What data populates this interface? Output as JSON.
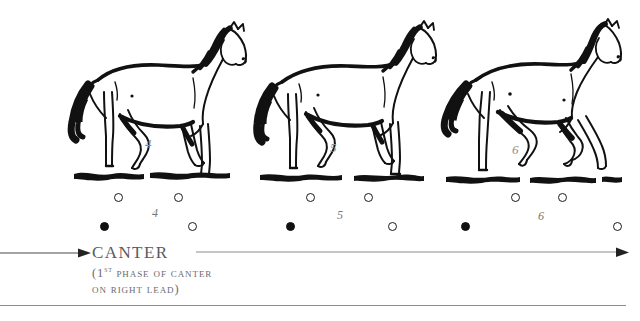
{
  "figure": {
    "title_main": "Canter",
    "subtitle_line1_prefix": "(1",
    "subtitle_line1_sup": "st",
    "subtitle_line1_rest": " phase of Canter",
    "subtitle_line2": "on right lead)",
    "ink_color": "#111111",
    "label_color": "#59595f",
    "number_color": "#8e8e90",
    "rule_color": "#8d8d92"
  },
  "frames": [
    {
      "id": "frame-4",
      "number": "4",
      "x": 60,
      "number_x": 145,
      "number_y": 136
    },
    {
      "id": "frame-5",
      "number": "5",
      "x": 248,
      "number_x": 330,
      "number_y": 140
    },
    {
      "id": "frame-6",
      "number": "6",
      "x": 432,
      "number_x": 512,
      "number_y": 142
    }
  ],
  "footfall_groups": [
    {
      "id": "footfall-group-4",
      "label": "4",
      "label_x": 152,
      "label_y": 206,
      "dots": [
        {
          "name": "hoof-dot-hind-left",
          "state": "hollow",
          "x": 114,
          "y": 193
        },
        {
          "name": "hoof-dot-hind-right",
          "state": "hollow",
          "x": 174,
          "y": 193
        },
        {
          "name": "hoof-dot-fore-left",
          "state": "filled",
          "x": 100,
          "y": 222
        },
        {
          "name": "hoof-dot-fore-right",
          "state": "hollow",
          "x": 188,
          "y": 222
        }
      ]
    },
    {
      "id": "footfall-group-5",
      "label": "5",
      "label_x": 337,
      "label_y": 208,
      "dots": [
        {
          "name": "hoof-dot-hind-left",
          "state": "hollow",
          "x": 306,
          "y": 193
        },
        {
          "name": "hoof-dot-hind-right",
          "state": "hollow",
          "x": 364,
          "y": 193
        },
        {
          "name": "hoof-dot-fore-left",
          "state": "filled",
          "x": 286,
          "y": 222
        },
        {
          "name": "hoof-dot-fore-right",
          "state": "hollow",
          "x": 388,
          "y": 222
        }
      ]
    },
    {
      "id": "footfall-group-6",
      "label": "6",
      "label_x": 538,
      "label_y": 209,
      "dots": [
        {
          "name": "hoof-dot-hind-left",
          "state": "hollow",
          "x": 511,
          "y": 193
        },
        {
          "name": "hoof-dot-hind-right",
          "state": "hollow",
          "x": 558,
          "y": 193
        },
        {
          "name": "hoof-dot-fore-left",
          "state": "filled",
          "x": 461,
          "y": 222
        },
        {
          "name": "hoof-dot-fore-right",
          "state": "hollow",
          "x": 613,
          "y": 222
        }
      ]
    }
  ],
  "arrows": [
    {
      "name": "direction-arrow-left",
      "x": 0,
      "y": 246,
      "width": 92
    },
    {
      "name": "direction-arrow-right",
      "x": 196,
      "y": 246,
      "width": 434
    }
  ],
  "rules": [
    {
      "name": "footer-rule",
      "x": 0,
      "y": 305,
      "width": 626,
      "height": 1
    }
  ]
}
